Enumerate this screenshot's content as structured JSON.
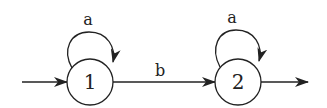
{
  "diagram": {
    "type": "finite-automaton",
    "states": [
      {
        "id": "1",
        "label": "1",
        "cx": 90,
        "cy": 82,
        "r": 23,
        "initial": true,
        "final": false
      },
      {
        "id": "2",
        "label": "2",
        "cx": 238,
        "cy": 82,
        "r": 23,
        "initial": false,
        "final": true
      }
    ],
    "transitions": [
      {
        "from": "1",
        "to": "1",
        "label": "a"
      },
      {
        "from": "1",
        "to": "2",
        "label": "b"
      },
      {
        "from": "2",
        "to": "2",
        "label": "a"
      }
    ],
    "stroke_color": "#222222"
  }
}
